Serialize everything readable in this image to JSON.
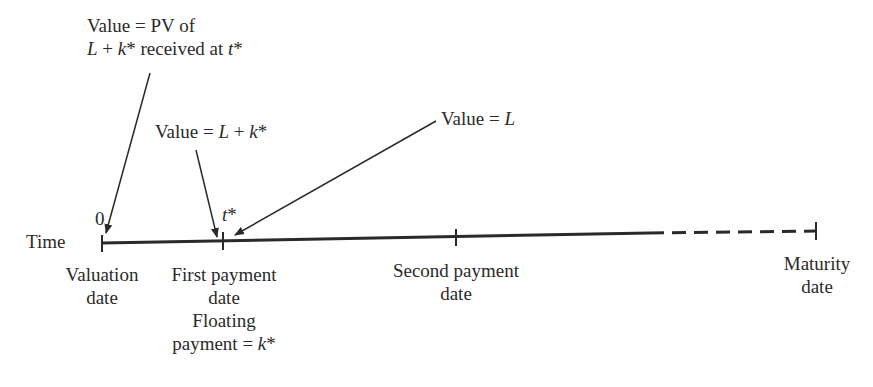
{
  "diagram": {
    "type": "timeline",
    "axis_label": "Time",
    "annotations": {
      "pv": {
        "line1": "Value = PV of",
        "line2_a": "L",
        "line2_b": " + ",
        "line2_c": "k",
        "line2_d": "* received at ",
        "line2_e": "t",
        "line2_f": "*"
      },
      "first": {
        "a": "Value = ",
        "b": "L",
        "c": " + ",
        "d": "k",
        "e": "*"
      },
      "after": {
        "a": "Value = ",
        "b": "L"
      }
    },
    "ticks": [
      {
        "label_top": "0",
        "label": [
          "Valuation",
          "date"
        ]
      },
      {
        "label_top_a": "t",
        "label_top_b": "*",
        "label": [
          "First payment",
          "date",
          "Floating"
        ],
        "last_a": "payment = ",
        "last_b": "k",
        "last_c": "*"
      },
      {
        "label": [
          "Second payment",
          "date"
        ]
      },
      {
        "label": [
          "Maturity",
          "date"
        ]
      }
    ],
    "colors": {
      "ink": "#2a2a2a",
      "background": "#ffffff"
    }
  }
}
